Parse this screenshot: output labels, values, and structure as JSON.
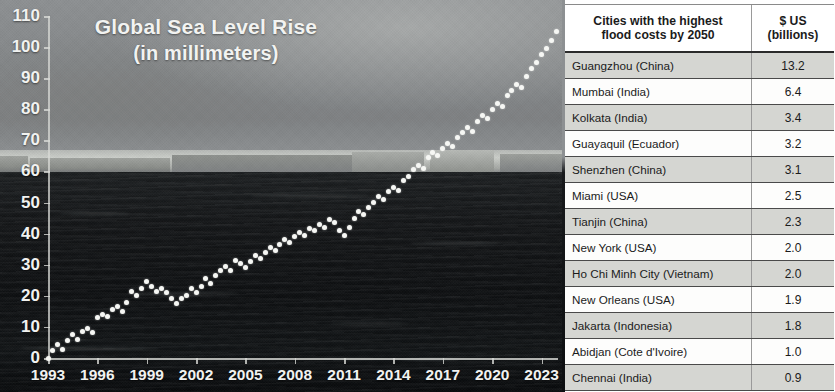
{
  "chart_data": {
    "type": "line",
    "title": "Global Sea Level Rise",
    "subtitle": "(in millimeters)",
    "xlabel": "",
    "ylabel": "",
    "ylim": [
      0,
      110
    ],
    "xlim": [
      1993,
      2024
    ],
    "ytick_labels": [
      "0",
      "10",
      "20",
      "30",
      "40",
      "50",
      "60",
      "70",
      "80",
      "90",
      "100",
      "110"
    ],
    "ytick_values": [
      0,
      10,
      20,
      30,
      40,
      50,
      60,
      70,
      80,
      90,
      100,
      110
    ],
    "xtick_labels": [
      "1993",
      "1996",
      "1999",
      "2002",
      "2005",
      "2008",
      "2011",
      "2014",
      "2017",
      "2020",
      "2023"
    ],
    "xtick_values": [
      1993,
      1996,
      1999,
      2002,
      2005,
      2008,
      2011,
      2014,
      2017,
      2020,
      2023
    ],
    "grid": false,
    "legend": "none",
    "marker": "circle",
    "series": [
      {
        "name": "Global mean sea level",
        "x": [
          1993.0,
          1993.3,
          1993.6,
          1993.9,
          1994.2,
          1994.5,
          1994.8,
          1995.1,
          1995.4,
          1995.7,
          1996.0,
          1996.3,
          1996.6,
          1996.9,
          1997.2,
          1997.5,
          1997.8,
          1998.1,
          1998.4,
          1998.7,
          1999.0,
          1999.3,
          1999.6,
          1999.9,
          2000.2,
          2000.5,
          2000.8,
          2001.1,
          2001.4,
          2001.7,
          2002.0,
          2002.3,
          2002.6,
          2002.9,
          2003.2,
          2003.5,
          2003.8,
          2004.1,
          2004.4,
          2004.7,
          2005.0,
          2005.3,
          2005.6,
          2005.9,
          2006.2,
          2006.5,
          2006.8,
          2007.1,
          2007.4,
          2007.7,
          2008.0,
          2008.3,
          2008.6,
          2008.9,
          2009.2,
          2009.5,
          2009.8,
          2010.1,
          2010.4,
          2010.7,
          2011.0,
          2011.3,
          2011.6,
          2011.9,
          2012.2,
          2012.5,
          2012.8,
          2013.1,
          2013.4,
          2013.7,
          2014.0,
          2014.3,
          2014.6,
          2014.9,
          2015.2,
          2015.5,
          2015.8,
          2016.1,
          2016.4,
          2016.7,
          2017.0,
          2017.3,
          2017.6,
          2017.9,
          2018.2,
          2018.5,
          2018.8,
          2019.1,
          2019.4,
          2019.7,
          2020.0,
          2020.3,
          2020.6,
          2020.9,
          2021.2,
          2021.5,
          2021.8,
          2022.1,
          2022.4,
          2022.7,
          2023.0,
          2023.3,
          2023.6,
          2023.9
        ],
        "y": [
          0.0,
          2.5,
          4.5,
          2.8,
          5.5,
          7.5,
          6.0,
          8.5,
          9.5,
          8.2,
          13.0,
          14.0,
          13.2,
          15.5,
          16.5,
          15.0,
          18.0,
          21.5,
          20.0,
          22.5,
          24.5,
          23.0,
          21.5,
          22.5,
          21.0,
          19.0,
          17.5,
          19.0,
          20.0,
          22.5,
          21.0,
          23.0,
          25.5,
          24.0,
          26.5,
          28.0,
          29.5,
          28.2,
          31.5,
          30.5,
          29.0,
          31.0,
          33.0,
          32.0,
          34.0,
          35.5,
          34.5,
          36.5,
          38.0,
          37.0,
          39.0,
          40.5,
          39.5,
          41.5,
          41.0,
          43.0,
          42.0,
          44.5,
          43.5,
          41.0,
          39.5,
          42.0,
          45.0,
          47.0,
          46.0,
          48.5,
          50.0,
          52.0,
          51.0,
          53.5,
          55.0,
          54.0,
          57.0,
          58.5,
          60.5,
          62.0,
          61.0,
          64.5,
          66.0,
          65.0,
          67.5,
          69.0,
          68.0,
          71.0,
          72.5,
          74.0,
          73.0,
          76.0,
          78.0,
          77.0,
          80.0,
          82.0,
          81.0,
          84.5,
          86.0,
          88.0,
          87.0,
          90.5,
          93.0,
          95.0,
          97.5,
          99.5,
          102.0,
          105.0
        ]
      }
    ]
  },
  "table": {
    "headers": {
      "city": "Cities with the highest\nflood costs by 2050",
      "city_line1": "Cities with the highest",
      "city_line2": "flood costs by 2050",
      "cost_line1": "$ US",
      "cost_line2": "(billions)"
    },
    "rows": [
      {
        "city": "Guangzhou (China)",
        "cost": "13.2"
      },
      {
        "city": "Mumbai (India)",
        "cost": "6.4"
      },
      {
        "city": "Kolkata (India)",
        "cost": "3.4"
      },
      {
        "city": "Guayaquil (Ecuador)",
        "cost": "3.2"
      },
      {
        "city": "Shenzhen (China)",
        "cost": "3.1"
      },
      {
        "city": "Miami (USA)",
        "cost": "2.5"
      },
      {
        "city": "Tianjin (China)",
        "cost": "2.3"
      },
      {
        "city": "New York (USA)",
        "cost": "2.0"
      },
      {
        "city": "Ho Chi Minh City (Vietnam)",
        "cost": "2.0"
      },
      {
        "city": "New Orleans (USA)",
        "cost": "1.9"
      },
      {
        "city": "Jakarta (Indonesia)",
        "cost": "1.8"
      },
      {
        "city": "Abidjan (Cote d'Ivoire)",
        "cost": "1.0"
      },
      {
        "city": "Chennai (India)",
        "cost": "0.9"
      }
    ]
  },
  "colors": {
    "marker": "#f6f7f4",
    "axis": "#d8dad6",
    "title_text": "#f2f3f1",
    "table_row_odd": "#d5d6d2",
    "table_row_even": "#fdfdfc",
    "table_text": "#1b1b1b"
  }
}
